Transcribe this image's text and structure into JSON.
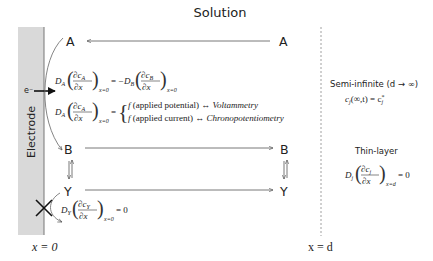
{
  "title": "Solution",
  "electrode": {
    "label": "Electrode",
    "electron": "e⁻",
    "fill": "#d9d9d9"
  },
  "species": {
    "left": [
      "A",
      "B",
      "Y"
    ],
    "right": [
      "A",
      "B",
      "Y"
    ]
  },
  "equations": {
    "flux_balance": {
      "lhs_coef": "D",
      "lhs_sub": "A",
      "lhs_num": "∂c",
      "lhs_num_sub": "A",
      "den": "∂x",
      "eval": "x=0",
      "eq": "= −",
      "rhs_coef": "D",
      "rhs_sub": "B",
      "rhs_num": "∂c",
      "rhs_num_sub": "B"
    },
    "flux_condition": {
      "coef": "D",
      "sub": "A",
      "num": "∂c",
      "num_sub": "A",
      "den": "∂x",
      "eval": "x=0",
      "eq": "=",
      "case1_f": "f",
      "case1_arg": "(applied potential)",
      "case1_arrow": "↔",
      "case1_method": "Voltammetry",
      "case2_f": "f",
      "case2_arg": "(applied current)",
      "case2_arrow": "↔",
      "case2_method": "Chronopotentiometry"
    },
    "y_flux": {
      "coef": "D",
      "sub": "Y",
      "num": "∂c",
      "num_sub": "Y",
      "den": "∂x",
      "eval": "x=0",
      "rhs": "= 0"
    }
  },
  "right_panel": {
    "semi_infinite_label": "Semi-infinite (d → ∞)",
    "semi_infinite_eq_lhs": "c",
    "semi_infinite_eq_sub": "j",
    "semi_infinite_eq_arg": "(∞,t) = c",
    "semi_infinite_eq_sup": "*",
    "semi_infinite_eq_sub2": "j",
    "thin_layer_label": "Thin-layer",
    "thin_coef": "D",
    "thin_sub": "j",
    "thin_num": "∂c",
    "thin_num_sub": "j",
    "thin_den": "∂x",
    "thin_eval": "x=d",
    "thin_rhs": "= 0"
  },
  "axis": {
    "left": "x = 0",
    "right": "x = d"
  }
}
